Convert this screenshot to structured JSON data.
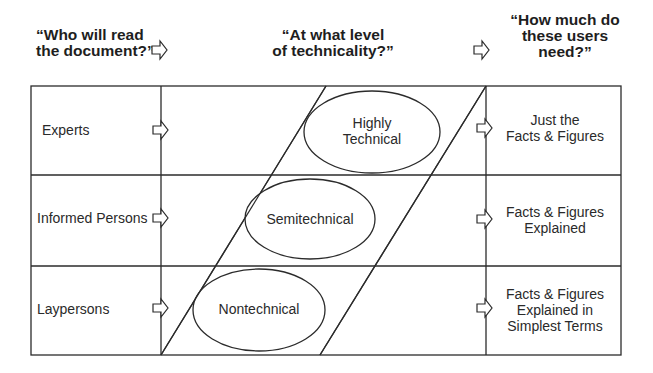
{
  "questions": {
    "who": {
      "lines": [
        "“Who will read",
        "the document?”"
      ]
    },
    "level": {
      "lines": [
        "“At what level",
        "of technicality?”"
      ]
    },
    "need": {
      "lines": [
        "“How much do",
        "these users",
        "need?”"
      ]
    }
  },
  "readers": [
    {
      "label": "Experts"
    },
    {
      "label": "Informed Persons"
    },
    {
      "label": "Laypersons"
    }
  ],
  "levels": [
    {
      "lines": [
        "Highly",
        "Technical"
      ]
    },
    {
      "lines": [
        "Semitechnical"
      ]
    },
    {
      "lines": [
        "Nontechnical"
      ]
    }
  ],
  "needs": [
    {
      "lines": [
        "Just the",
        "Facts & Figures"
      ]
    },
    {
      "lines": [
        "Facts & Figures",
        "Explained"
      ]
    },
    {
      "lines": [
        "Facts & Figures",
        "Explained in",
        "Simplest Terms"
      ]
    }
  ],
  "icons": {
    "arrow": "block-arrow-right-icon"
  },
  "colors": {
    "line": "#2b2b2b",
    "arrow_fill": "#ffffff",
    "background": "#ffffff"
  }
}
